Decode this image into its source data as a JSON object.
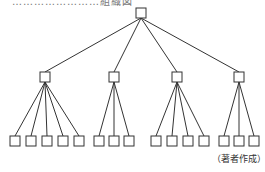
{
  "title_clipped": "……………………組織図",
  "caption": "（著者作成）",
  "tree": {
    "root": {
      "x": 141,
      "y": 13
    },
    "branches": [
      {
        "x": 45,
        "y": 77,
        "leaves": [
          15,
          31,
          47,
          63,
          79
        ]
      },
      {
        "x": 114,
        "y": 77,
        "leaves": [
          99,
          114,
          129
        ]
      },
      {
        "x": 177,
        "y": 77,
        "leaves": [
          156,
          172,
          188,
          204
        ]
      },
      {
        "x": 239,
        "y": 77,
        "leaves": [
          224,
          239,
          254
        ]
      }
    ],
    "leaf_y": 141,
    "box": 10
  },
  "colors": {
    "stroke": "#333333",
    "fill": "#ffffff"
  }
}
